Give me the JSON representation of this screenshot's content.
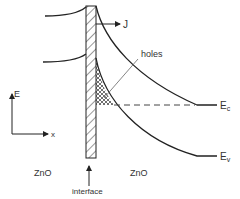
{
  "diagram": {
    "type": "band-diagram",
    "colors": {
      "line": "#222222",
      "text": "#333333",
      "leader": "#666666"
    },
    "labels": {
      "current": "J",
      "holes": "holes",
      "conduction_band": "E",
      "conduction_band_sub": "c",
      "valence_band": "E",
      "valence_band_sub": "v",
      "axis_energy": "E",
      "axis_position": "x",
      "left_material": "ZnO",
      "right_material": "ZnO",
      "interface": "interface"
    }
  }
}
